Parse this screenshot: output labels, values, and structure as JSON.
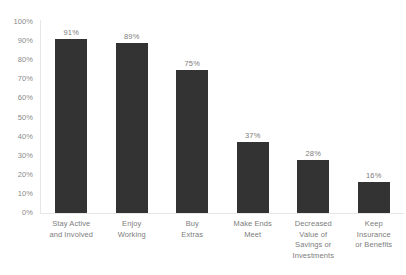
{
  "chart_data": {
    "type": "bar",
    "title": "",
    "subtitle": "",
    "xlabel": "",
    "ylabel": "",
    "ylim": [
      0,
      100
    ],
    "grid": false,
    "legend": false,
    "categories": [
      "Stay Active and Involved",
      "Enjoy Working",
      "Buy Extras",
      "Make Ends Meet",
      "Decreased Value of Savings or Investments",
      "Keep Insurance or Benefits"
    ],
    "category_lines": [
      [
        "Stay Active",
        "and Involved"
      ],
      [
        "Enjoy",
        "Working"
      ],
      [
        "Buy",
        "Extras"
      ],
      [
        "Make Ends",
        "Meet"
      ],
      [
        "Decreased",
        "Value of",
        "Savings or",
        "Investments"
      ],
      [
        "Keep",
        "Insurance",
        "or Benefits"
      ]
    ],
    "values": [
      91,
      89,
      75,
      37,
      28,
      16
    ],
    "value_labels": [
      "91%",
      "89%",
      "75%",
      "37%",
      "28%",
      "16%"
    ],
    "y_ticks": [
      100,
      90,
      80,
      70,
      60,
      50,
      40,
      30,
      20,
      10,
      0
    ],
    "y_tick_labels": [
      "100%",
      "90%",
      "80%",
      "70%",
      "60%",
      "50%",
      "40%",
      "30%",
      "20%",
      "10%",
      "0%"
    ],
    "bar_color": "#333333",
    "axis_line_color": "#e7e7e7",
    "text_color": "#7d7d7d",
    "background_color": "#ffffff"
  }
}
